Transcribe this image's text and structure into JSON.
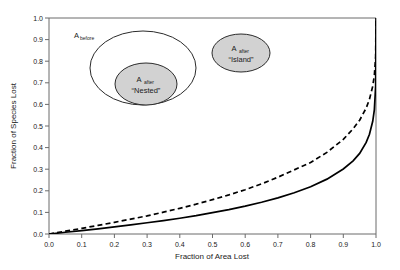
{
  "chart_data": {
    "type": "line",
    "title": "",
    "xlabel": "Fraction of Area Lost",
    "ylabel": "Fraction of Species Lost",
    "xlim": [
      0.0,
      1.0
    ],
    "ylim": [
      0.0,
      1.0
    ],
    "grid": false,
    "legend_position": "none",
    "xticks": [
      "0.0",
      "0.1",
      "0.2",
      "0.3",
      "0.4",
      "0.5",
      "0.6",
      "0.7",
      "0.8",
      "0.9",
      "1.0"
    ],
    "yticks": [
      "0.0",
      "0.1",
      "0.2",
      "0.3",
      "0.4",
      "0.5",
      "0.6",
      "0.7",
      "0.8",
      "0.9",
      "1.0"
    ],
    "x": [
      0.0,
      0.05,
      0.1,
      0.15,
      0.2,
      0.25,
      0.3,
      0.35,
      0.4,
      0.45,
      0.5,
      0.55,
      0.6,
      0.65,
      0.7,
      0.75,
      0.8,
      0.85,
      0.9,
      0.93,
      0.95,
      0.97,
      0.98,
      0.99,
      0.995,
      0.999,
      1.0
    ],
    "series": [
      {
        "name": "Nested",
        "style": "solid",
        "color": "#000000",
        "note": "S_lost = 1 - (1 - A_lost)^z, z = 0.15",
        "values": [
          0.0,
          0.008,
          0.016,
          0.024,
          0.033,
          0.042,
          0.052,
          0.062,
          0.073,
          0.085,
          0.099,
          0.113,
          0.129,
          0.147,
          0.167,
          0.191,
          0.219,
          0.254,
          0.301,
          0.339,
          0.373,
          0.424,
          0.462,
          0.522,
          0.576,
          0.686,
          1.0
        ]
      },
      {
        "name": "Island",
        "style": "dashed",
        "color": "#000000",
        "note": "S_lost = 1 - (1 - A_lost)^z, z = 0.25",
        "values": [
          0.0,
          0.013,
          0.026,
          0.04,
          0.054,
          0.069,
          0.084,
          0.101,
          0.119,
          0.138,
          0.159,
          0.181,
          0.205,
          0.232,
          0.263,
          0.297,
          0.331,
          0.378,
          0.438,
          0.487,
          0.527,
          0.583,
          0.624,
          0.684,
          0.735,
          0.822,
          1.0
        ]
      }
    ],
    "annotations": [
      {
        "id": "a-before",
        "text": "A",
        "subscript": "before",
        "type": "ellipse-label"
      },
      {
        "id": "a-after-nested",
        "text": "A",
        "subscript": "after",
        "caption": "“Nested”",
        "type": "ellipse-label"
      },
      {
        "id": "a-after-island",
        "text": "A",
        "subscript": "after",
        "caption": "“Island”",
        "type": "ellipse-label"
      }
    ]
  },
  "axes": {
    "xlabel": "Fraction of Area Lost",
    "ylabel": "Fraction of Species Lost",
    "xticks": [
      "0.0",
      "0.1",
      "0.2",
      "0.3",
      "0.4",
      "0.5",
      "0.6",
      "0.7",
      "0.8",
      "0.9",
      "1.0"
    ],
    "yticks": [
      "0.0",
      "0.1",
      "0.2",
      "0.3",
      "0.4",
      "0.5",
      "0.6",
      "0.7",
      "0.8",
      "0.9",
      "1.0"
    ]
  },
  "inset": {
    "before_label": "A",
    "before_sub": "before",
    "nested_label": "A",
    "nested_sub": "after",
    "nested_caption": "“Nested”",
    "island_label": "A",
    "island_sub": "after",
    "island_caption": "“Island”",
    "fill_gray": "#d2d2d2",
    "stroke": "#2b2b2b"
  }
}
